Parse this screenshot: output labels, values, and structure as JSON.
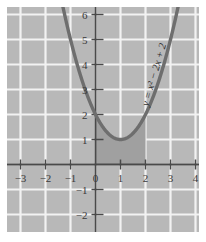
{
  "chart_data": {
    "type": "line",
    "title": "",
    "xlabel": "",
    "ylabel": "",
    "equation_label": "y = x² − 2x + 2",
    "function": "y = x^2 - 2x + 2",
    "xlim": [
      -3.75,
      4.75
    ],
    "ylim": [
      -2.75,
      7.0
    ],
    "grid": true,
    "legend": null,
    "plot_background_color": "#b8b8b8",
    "gridline_color": "#f2f2f2",
    "curve_color": "#6e6e6e",
    "axis_color": "#4a4a4a",
    "shade_color": "#a0a0a0",
    "vertex": [
      1,
      1
    ],
    "y_intercept": 2,
    "shaded_region": {
      "x_start": 0,
      "x_end": 2,
      "y_base": 0,
      "description": "area under curve from x=0 to x=2"
    },
    "x_ticks": [
      -3,
      -2,
      -1,
      0,
      1,
      2,
      3,
      4
    ],
    "x_tick_labels": [
      "-3",
      "-2",
      "-1",
      "0",
      "1",
      "2",
      "3",
      "4"
    ],
    "y_ticks": [
      -2,
      -1,
      1,
      2,
      3,
      4,
      5,
      6
    ],
    "y_tick_labels": [
      "-2",
      "-1",
      "1",
      "2",
      "3",
      "4",
      "5",
      "6"
    ],
    "x": [
      -2.0,
      -1.8,
      -1.6,
      -1.4,
      -1.2,
      -1.0,
      -0.8,
      -0.6,
      -0.4,
      -0.2,
      0.0,
      0.2,
      0.4,
      0.6,
      0.8,
      1.0,
      1.2,
      1.4,
      1.6,
      1.8,
      2.0,
      2.2,
      2.4,
      2.6,
      2.8,
      3.0,
      3.2,
      3.4
    ],
    "values": [
      10.0,
      8.84,
      7.76,
      6.76,
      5.84,
      5.0,
      4.24,
      3.56,
      2.96,
      2.44,
      2.0,
      1.64,
      1.36,
      1.16,
      1.04,
      1.0,
      1.04,
      1.16,
      1.36,
      1.64,
      2.0,
      2.44,
      2.96,
      3.56,
      4.24,
      5.0,
      5.84,
      6.76
    ]
  },
  "figure": {
    "name": "parabola-plot"
  }
}
